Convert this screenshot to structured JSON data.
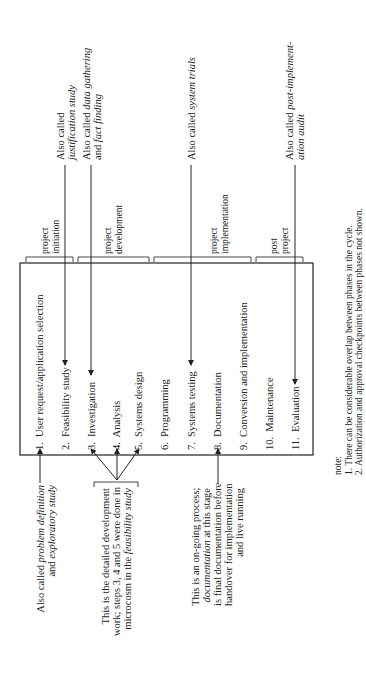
{
  "diagram": {
    "phases": [
      {
        "label_1": "project",
        "label_2": "initiation"
      },
      {
        "label_1": "project",
        "label_2": "development"
      },
      {
        "label_1": "project",
        "label_2": "implementation"
      },
      {
        "label_1": "post",
        "label_2": "project"
      }
    ],
    "steps": [
      {
        "num": "1.",
        "label": "User request/application selection"
      },
      {
        "num": "2.",
        "label": "Feasibility study"
      },
      {
        "num": "3.",
        "label": "Investigation"
      },
      {
        "num": "4.",
        "label": "Analysis"
      },
      {
        "num": "5.",
        "label": "Systems design"
      },
      {
        "num": "6.",
        "label": "Programming"
      },
      {
        "num": "7.",
        "label": "Systems testing"
      },
      {
        "num": "8.",
        "label": "Documentation"
      },
      {
        "num": "9.",
        "label": "Conversion and implementation"
      },
      {
        "num": "10.",
        "label": "Maintenance"
      },
      {
        "num": "11.",
        "label": "Evaluation"
      }
    ],
    "right_annotations": {
      "feasibility": {
        "line1": "Also called",
        "line2_italic": "justification study"
      },
      "investigation": {
        "line1_plain": "Also called ",
        "line1_italic": "data gathering",
        "line2_plain": "and ",
        "line2_italic": "fact finding"
      },
      "testing": {
        "plain": "Also called ",
        "italic": "system trials"
      },
      "evaluation": {
        "line1_plain": "Also called ",
        "line1_italic": "post-implement-",
        "line2_italic": "ation audit"
      }
    },
    "left_annotations": {
      "step1": {
        "line1_plain": "Also called ",
        "line1_italic": "problem definition",
        "line2_plain": "and ",
        "line2_italic": "exploratory study"
      },
      "steps345": {
        "line1": "This is the detailed development",
        "line2": "work; steps 3, 4 and 5 were done in",
        "line3_plain": "microcosm in the ",
        "line3_italic": "feasibility study"
      },
      "step8": {
        "line1": "This is an on-going process;",
        "line2_italic": "documentation",
        "line2_plain": " at this stage",
        "line3": "is final documentation before",
        "line4": "handover for implementation",
        "line5": "and live running"
      }
    },
    "notes": {
      "heading": "note:",
      "items": [
        "1.  There can be considerable overlap between phases in the cycle.",
        "2.  Authorization and approval checkpoints between phases not shown."
      ]
    }
  }
}
